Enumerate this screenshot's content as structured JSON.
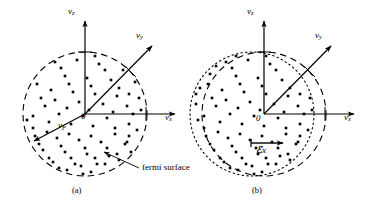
{
  "figure": {
    "background_color": "#ffffff",
    "stroke_color": "#000000",
    "width": 378,
    "height": 208
  },
  "panels": [
    {
      "id": "a",
      "caption": "(a)",
      "axes": {
        "vz": "v",
        "vz_sub": "z",
        "vy": "v",
        "vy_sub": "y",
        "vx": "v",
        "vx_sub": "x",
        "origin": "0"
      },
      "vf_label": "v",
      "vf_sub": "F",
      "annotation": "fermi surface",
      "circle": {
        "style": "dashed",
        "cx": 85,
        "cy": 114,
        "r": 62
      }
    },
    {
      "id": "b",
      "caption": "(b)",
      "axes": {
        "vz": "v",
        "vz_sub": "z",
        "vy": "v",
        "vy_sub": "y",
        "vx": "v",
        "vx_sub": "x",
        "origin": "0"
      },
      "field_label": "ℰ",
      "field_sub": "x",
      "circles": [
        {
          "style": "dashed",
          "cx": 264,
          "cy": 114,
          "r": 62
        },
        {
          "style": "dotted",
          "cx": 252,
          "cy": 114,
          "r": 62
        }
      ]
    }
  ],
  "chart_data": {
    "type": "scatter",
    "xlabel": "v_x",
    "ylabel": "v_z",
    "zlabel": "v_y",
    "panel_a_points": [
      [
        -30,
        -52
      ],
      [
        -8,
        -54
      ],
      [
        14,
        -50
      ],
      [
        38,
        -44
      ],
      [
        -46,
        -40
      ],
      [
        -20,
        -38
      ],
      [
        2,
        -36
      ],
      [
        26,
        -34
      ],
      [
        50,
        -32
      ],
      [
        -56,
        -26
      ],
      [
        -34,
        -24
      ],
      [
        -12,
        -22
      ],
      [
        10,
        -20
      ],
      [
        32,
        -18
      ],
      [
        54,
        -16
      ],
      [
        -60,
        -10
      ],
      [
        -40,
        -8
      ],
      [
        -18,
        -6
      ],
      [
        4,
        -4
      ],
      [
        28,
        -2
      ],
      [
        48,
        0
      ],
      [
        -58,
        6
      ],
      [
        -36,
        8
      ],
      [
        -14,
        10
      ],
      [
        8,
        12
      ],
      [
        30,
        14
      ],
      [
        52,
        16
      ],
      [
        -50,
        22
      ],
      [
        -28,
        24
      ],
      [
        -6,
        26
      ],
      [
        16,
        28
      ],
      [
        40,
        30
      ],
      [
        56,
        26
      ],
      [
        -42,
        36
      ],
      [
        -20,
        38
      ],
      [
        2,
        40
      ],
      [
        24,
        42
      ],
      [
        46,
        38
      ],
      [
        -32,
        48
      ],
      [
        -10,
        50
      ],
      [
        12,
        50
      ],
      [
        34,
        46
      ],
      [
        -18,
        56
      ],
      [
        6,
        58
      ],
      [
        28,
        54
      ],
      [
        -2,
        60
      ],
      [
        18,
        60
      ],
      [
        -48,
        -30
      ],
      [
        -24,
        -46
      ],
      [
        44,
        -20
      ],
      [
        -52,
        14
      ],
      [
        44,
        10
      ],
      [
        -44,
        -16
      ],
      [
        20,
        -44
      ],
      [
        -16,
        -30
      ],
      [
        6,
        -28
      ],
      [
        34,
        -26
      ],
      [
        -30,
        -14
      ],
      [
        -6,
        -12
      ],
      [
        18,
        -10
      ],
      [
        42,
        -8
      ],
      [
        -52,
        2
      ],
      [
        -26,
        0
      ],
      [
        -2,
        2
      ],
      [
        22,
        4
      ],
      [
        44,
        22
      ],
      [
        -38,
        18
      ],
      [
        -16,
        20
      ],
      [
        6,
        22
      ],
      [
        30,
        20
      ],
      [
        -46,
        30
      ],
      [
        -24,
        32
      ],
      [
        0,
        34
      ],
      [
        22,
        34
      ],
      [
        42,
        28
      ],
      [
        -36,
        44
      ],
      [
        -14,
        44
      ],
      [
        10,
        44
      ],
      [
        32,
        40
      ],
      [
        -26,
        54
      ],
      [
        -4,
        52
      ],
      [
        20,
        50
      ],
      [
        10,
        -58
      ],
      [
        -20,
        -58
      ],
      [
        36,
        -52
      ],
      [
        -40,
        -48
      ],
      [
        48,
        -40
      ],
      [
        56,
        -4
      ],
      [
        -60,
        -20
      ],
      [
        -56,
        36
      ]
    ],
    "panel_b_points": [
      [
        -26,
        -52
      ],
      [
        -4,
        -54
      ],
      [
        18,
        -50
      ],
      [
        42,
        -44
      ],
      [
        -42,
        -40
      ],
      [
        -16,
        -38
      ],
      [
        6,
        -36
      ],
      [
        30,
        -34
      ],
      [
        54,
        -32
      ],
      [
        -52,
        -26
      ],
      [
        -30,
        -24
      ],
      [
        -8,
        -22
      ],
      [
        14,
        -20
      ],
      [
        36,
        -18
      ],
      [
        58,
        -16
      ],
      [
        -56,
        -10
      ],
      [
        -36,
        -8
      ],
      [
        -14,
        -6
      ],
      [
        8,
        -4
      ],
      [
        32,
        -2
      ],
      [
        52,
        0
      ],
      [
        -54,
        6
      ],
      [
        -32,
        8
      ],
      [
        -10,
        10
      ],
      [
        12,
        12
      ],
      [
        34,
        14
      ],
      [
        56,
        16
      ],
      [
        -46,
        22
      ],
      [
        -24,
        24
      ],
      [
        -2,
        26
      ],
      [
        20,
        28
      ],
      [
        44,
        30
      ],
      [
        60,
        26
      ],
      [
        -38,
        36
      ],
      [
        -16,
        38
      ],
      [
        6,
        40
      ],
      [
        28,
        42
      ],
      [
        50,
        38
      ],
      [
        -28,
        48
      ],
      [
        -6,
        50
      ],
      [
        16,
        50
      ],
      [
        38,
        46
      ],
      [
        -14,
        56
      ],
      [
        10,
        58
      ],
      [
        32,
        54
      ],
      [
        2,
        60
      ],
      [
        22,
        60
      ],
      [
        -44,
        -30
      ],
      [
        -20,
        -46
      ],
      [
        48,
        -20
      ],
      [
        -48,
        14
      ],
      [
        48,
        10
      ],
      [
        -40,
        -16
      ],
      [
        24,
        -44
      ],
      [
        -12,
        -30
      ],
      [
        10,
        -28
      ],
      [
        38,
        -26
      ],
      [
        -26,
        -14
      ],
      [
        -2,
        -12
      ],
      [
        22,
        -10
      ],
      [
        46,
        -8
      ],
      [
        -48,
        2
      ],
      [
        -22,
        0
      ],
      [
        2,
        2
      ],
      [
        26,
        4
      ],
      [
        48,
        22
      ],
      [
        -34,
        18
      ],
      [
        -12,
        20
      ],
      [
        10,
        22
      ],
      [
        34,
        20
      ],
      [
        -42,
        30
      ],
      [
        -20,
        32
      ],
      [
        4,
        34
      ],
      [
        26,
        34
      ],
      [
        46,
        28
      ],
      [
        -32,
        44
      ],
      [
        -10,
        44
      ],
      [
        14,
        44
      ],
      [
        36,
        40
      ],
      [
        -22,
        54
      ],
      [
        0,
        52
      ],
      [
        24,
        50
      ],
      [
        14,
        -58
      ],
      [
        -16,
        -58
      ],
      [
        40,
        -52
      ],
      [
        -36,
        -48
      ],
      [
        52,
        -40
      ],
      [
        60,
        -4
      ],
      [
        -56,
        -20
      ],
      [
        -52,
        36
      ]
    ]
  }
}
